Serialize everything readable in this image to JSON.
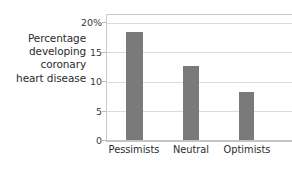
{
  "chart_data": {
    "type": "bar",
    "title": "",
    "subtitle": "",
    "xlabel": "",
    "ylabel": "Percentage developing coronary heart disease",
    "ylabel_lines": [
      "Percentage",
      "developing",
      "coronary",
      "heart disease"
    ],
    "categories": [
      "Pessimists",
      "Neutral",
      "Optimists"
    ],
    "values": [
      17.2,
      11.8,
      7.7
    ],
    "ylim": [
      0,
      20
    ],
    "yticks": [
      0,
      5,
      10,
      15,
      20
    ],
    "ytick_labels": [
      "0",
      "5",
      "10",
      "15",
      "20%"
    ],
    "grid": true,
    "grid_axis": "y",
    "legend": false,
    "legend_position": "none",
    "bar_color": "#7a7a7a",
    "grid_color": "#dcdcdc",
    "axis_color": "#c4c4c4",
    "background_color": "#ffffff",
    "text_color": "#2b2b2b"
  }
}
